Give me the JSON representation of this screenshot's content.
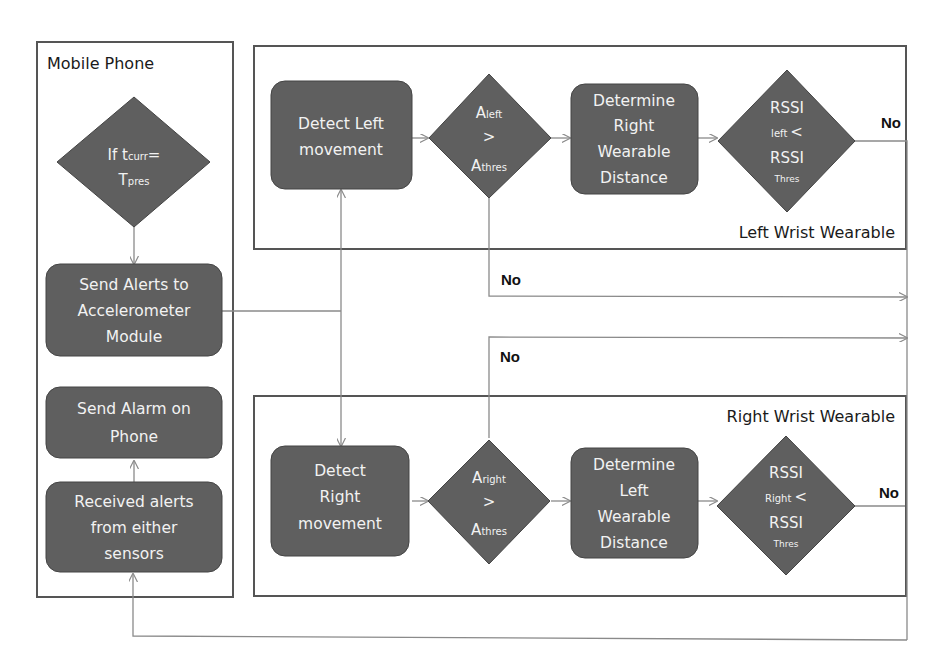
{
  "colors": {
    "node_fill": "#5f5f5f",
    "node_stroke": "#444444",
    "node_text": "#f2f2f2",
    "container_stroke": "#555555",
    "connector": "#8a8a8a",
    "label_text": "#1a1a1a"
  },
  "containers": {
    "mobile_phone": {
      "title": "Mobile Phone"
    },
    "left_wrist": {
      "title": "Left Wrist Wearable"
    },
    "right_wrist": {
      "title": "Right Wrist Wearable"
    }
  },
  "mobile_phone": {
    "decision_time": {
      "line1_prefix": "If t",
      "line1_sub": "curr",
      "line1_suffix": "=",
      "line2_main": "T",
      "line2_sub": "pres"
    },
    "send_alerts": {
      "lines": [
        "Send Alerts to",
        "Accelerometer",
        "Module"
      ]
    },
    "send_alarm": {
      "lines": [
        "Send Alarm on",
        "Phone"
      ]
    },
    "received_alerts": {
      "lines": [
        "Received alerts",
        "from either",
        "sensors"
      ]
    }
  },
  "left_wrist": {
    "detect": {
      "lines": [
        "Detect Left",
        "movement"
      ]
    },
    "accel_decision": {
      "top_main": "A",
      "top_sub": "left",
      "op": ">",
      "bottom_main": "A",
      "bottom_sub": "thres"
    },
    "distance": {
      "lines": [
        "Determine",
        "Right",
        "Wearable",
        "Distance"
      ]
    },
    "rssi_decision": {
      "top": "RSSI",
      "mid_sub": "left",
      "op": "<",
      "bottom": "RSSI",
      "bottom_sub": "Thres"
    }
  },
  "right_wrist": {
    "detect": {
      "lines": [
        "Detect",
        "Right",
        "movement"
      ]
    },
    "accel_decision": {
      "top_main": "A",
      "top_sub": "right",
      "op": ">",
      "bottom_main": "A",
      "bottom_sub": "thres"
    },
    "distance": {
      "lines": [
        "Determine",
        "Left",
        "Wearable",
        "Distance"
      ]
    },
    "rssi_decision": {
      "top": "RSSI",
      "mid_sub": "Right",
      "op": "<",
      "bottom": "RSSI",
      "bottom_sub": "Thres"
    }
  },
  "edge_labels": {
    "left_rssi_no": "No",
    "left_accel_no": "No",
    "right_accel_no": "No",
    "right_rssi_no": "No"
  }
}
